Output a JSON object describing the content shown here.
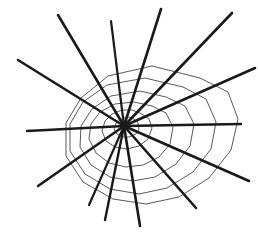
{
  "figure": {
    "background_color": "#ffffff",
    "canvas": {
      "width": 258,
      "height": 248
    }
  },
  "chart_data": {
    "type": "scatter",
    "xlabel": "",
    "ylabel": "",
    "grid": false,
    "legend": false,
    "center": {
      "x": 124,
      "y": 126
    },
    "spoke_color": "#1a1a1a",
    "ring_color": "#3a3a3a",
    "spoke_width": 2.6,
    "ring_width": 0.85,
    "spoke_count": 14,
    "ring_count": 6,
    "spokes": [
      {
        "index": 0,
        "angle_deg": 0,
        "tip_x": 241,
        "tip_y": 124,
        "width": 2.5
      },
      {
        "index": 1,
        "angle_deg": 26,
        "tip_x": 255,
        "tip_y": 68,
        "width": 2.6
      },
      {
        "index": 2,
        "angle_deg": 50,
        "tip_x": 232,
        "tip_y": 13,
        "width": 2.6
      },
      {
        "index": 3,
        "angle_deg": 75,
        "tip_x": 161,
        "tip_y": 9,
        "width": 2.6
      },
      {
        "index": 4,
        "angle_deg": 96,
        "tip_x": 111,
        "tip_y": 21,
        "width": 2.2
      },
      {
        "index": 5,
        "angle_deg": 120,
        "tip_x": 58,
        "tip_y": 15,
        "width": 2.6
      },
      {
        "index": 6,
        "angle_deg": 152,
        "tip_x": 18,
        "tip_y": 60,
        "width": 2.6
      },
      {
        "index": 7,
        "angle_deg": 180,
        "tip_x": 27,
        "tip_y": 131,
        "width": 2.3
      },
      {
        "index": 8,
        "angle_deg": 211,
        "tip_x": 38,
        "tip_y": 186,
        "width": 2.6
      },
      {
        "index": 9,
        "angle_deg": 238,
        "tip_x": 89,
        "tip_y": 205,
        "width": 2.2
      },
      {
        "index": 10,
        "angle_deg": 256,
        "tip_x": 105,
        "tip_y": 220,
        "width": 2.4
      },
      {
        "index": 11,
        "angle_deg": 275,
        "tip_x": 140,
        "tip_y": 226,
        "width": 2.6
      },
      {
        "index": 12,
        "angle_deg": 300,
        "tip_x": 196,
        "tip_y": 208,
        "width": 2.6
      },
      {
        "index": 13,
        "angle_deg": 330,
        "tip_x": 249,
        "tip_y": 181,
        "width": 2.6
      }
    ],
    "rings": [
      {
        "index": 0,
        "name": "inner-ring-1",
        "points": "134,119 138,123 139,129 136,134 129,137 122,137 117,134 114,129 116,123 120,120 124,118 129,117"
      },
      {
        "index": 1,
        "name": "inner-ring-2",
        "points": "140,113 149,119 152,128 148,139 139,146 127,149 115,147 106,141 102,131 105,121 112,114 122,110 132,110"
      },
      {
        "index": 2,
        "name": "mid-ring-1",
        "points": "152,106 166,113 173,127 170,144 159,157 143,165 126,167 109,163 96,153 89,139 91,124 100,112 115,104 134,102"
      },
      {
        "index": 3,
        "name": "mid-ring-2",
        "points": "166,97 185,106 194,124 190,146 176,164 155,177 133,181 110,177 91,165 80,147 81,126 92,109 111,96 140,91"
      },
      {
        "index": 4,
        "name": "outer-ring-1",
        "points": "183,87 206,99 216,122 211,149 193,172 167,188 139,194 110,189 85,174 70,151 70,124 83,102 107,85 145,78"
      },
      {
        "index": 5,
        "name": "outer-ring-2",
        "points": "200,78 228,92 238,119 231,150 209,178 179,197 146,204 113,199 83,182 66,156 66,123 81,98 108,76 152,66"
      }
    ]
  }
}
